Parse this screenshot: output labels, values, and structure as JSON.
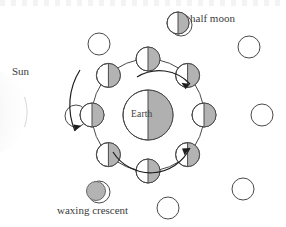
{
  "diagram": {
    "title_labels": {
      "sun": "Sun",
      "earth": "Earth",
      "half_moon": "half moon",
      "waxing_crescent": "waxing crescent"
    },
    "colors": {
      "outline": "#4a4a4a",
      "shade": "#b3b3b3",
      "earth_shade": "#b0b0b0",
      "text": "#3b3b3b",
      "background": "#ffffff",
      "sun_glow": "#ededed"
    },
    "geometry": {
      "center": {
        "x": 148,
        "y": 115
      },
      "earth_radius": 25,
      "orbit_radius": 56,
      "moon_radius": 12,
      "outer_radius": 11,
      "outer_ring_radius": 92
    },
    "earth": {
      "label": "Earth",
      "lit_side": "right"
    },
    "sun": {
      "label": "Sun",
      "position": "left",
      "arc_center_x": -18,
      "arc_center_y": 112,
      "arc_radius": 45
    },
    "orbit_moons": [
      {
        "name": "moon-top",
        "angle_deg": 270,
        "lit_side": "right",
        "phase": "half moon"
      },
      {
        "name": "moon-top-right",
        "angle_deg": 315,
        "lit_side": "right",
        "phase": "gibbous"
      },
      {
        "name": "moon-right",
        "angle_deg": 0,
        "lit_side": "right",
        "phase": "full"
      },
      {
        "name": "moon-bottom-right",
        "angle_deg": 45,
        "lit_side": "right",
        "phase": "gibbous"
      },
      {
        "name": "moon-bottom",
        "angle_deg": 90,
        "lit_side": "right",
        "phase": "half moon"
      },
      {
        "name": "moon-bottom-left",
        "angle_deg": 135,
        "lit_side": "right",
        "phase": "crescent"
      },
      {
        "name": "moon-left",
        "angle_deg": 180,
        "lit_side": "right",
        "phase": "new"
      },
      {
        "name": "moon-top-left",
        "angle_deg": 225,
        "lit_side": "right",
        "phase": "crescent"
      }
    ],
    "outer_phase_circles": [
      {
        "name": "phase-top",
        "cx": 181,
        "cy": 25,
        "style": "outline"
      },
      {
        "name": "phase-top-right",
        "cx": 249,
        "cy": 47,
        "style": "outline"
      },
      {
        "name": "phase-right",
        "cx": 262,
        "cy": 115,
        "style": "outline"
      },
      {
        "name": "phase-bottom-right",
        "cx": 243,
        "cy": 189,
        "style": "outline"
      },
      {
        "name": "phase-bottom",
        "cx": 168,
        "cy": 208,
        "style": "outline"
      },
      {
        "name": "phase-bottom-left",
        "cx": 97,
        "cy": 192,
        "style": "crescent"
      },
      {
        "name": "phase-left",
        "cx": 76,
        "cy": 116,
        "style": "outline"
      },
      {
        "name": "phase-top-left",
        "cx": 99,
        "cy": 44,
        "style": "outline"
      }
    ],
    "arrows": [
      {
        "name": "orbit-arrow-upper",
        "direction": "counterclockwise",
        "head": "upper-right"
      },
      {
        "name": "orbit-arrow-lower",
        "direction": "counterclockwise",
        "head": "lower-right"
      },
      {
        "name": "orbit-arrow-left",
        "direction": "counterclockwise",
        "head": "lower-left"
      }
    ]
  }
}
